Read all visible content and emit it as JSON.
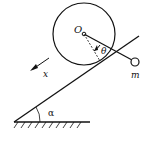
{
  "diagram": {
    "labels": {
      "origin": "O",
      "angle_theta": "θ",
      "mass": "m",
      "axis_x": "x",
      "angle_alpha": "α"
    },
    "elements": {
      "wheel": "circle centered at O rolling on incline",
      "pendulum": "rod from O to point mass m",
      "incline": "inclined plane at angle α to ground",
      "ground": "hatched horizontal ground",
      "direction_arrow": "arrow indicating x direction down the incline"
    },
    "colors": {
      "stroke": "#111111",
      "background": "#ffffff"
    }
  }
}
